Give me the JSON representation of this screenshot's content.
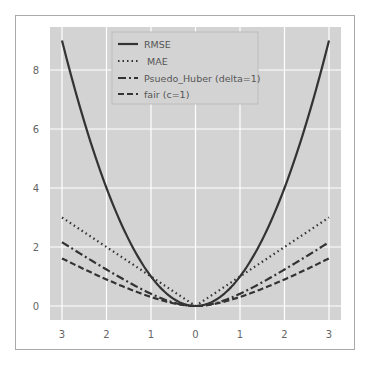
{
  "chart_data": {
    "type": "line",
    "title": "",
    "xlabel": "",
    "ylabel": "",
    "xlim": [
      -3.3,
      3.2
    ],
    "ylim": [
      -0.45,
      9.7
    ],
    "grid": true,
    "legend_position": "upper center",
    "x_ticks": [
      -3,
      -2,
      -1,
      0,
      1,
      2,
      3
    ],
    "x_tick_labels": [
      "3",
      "2",
      "1",
      "0",
      "1",
      "2",
      "3"
    ],
    "y_ticks": [
      0,
      2,
      4,
      6,
      8
    ],
    "y_tick_labels": [
      "0",
      "2",
      "4",
      "6",
      "8"
    ],
    "x": [
      -3,
      -2.5,
      -2,
      -1.5,
      -1,
      -0.5,
      0,
      0.5,
      1,
      1.5,
      2,
      2.5,
      3
    ],
    "series": [
      {
        "name": "RMSE",
        "style": "solid",
        "values": [
          9,
          6.25,
          4,
          2.25,
          1,
          0.25,
          0,
          0.25,
          1,
          2.25,
          4,
          6.25,
          9
        ]
      },
      {
        "name": "MAE",
        "style": "dotted",
        "values": [
          3,
          2.5,
          2,
          1.5,
          1,
          0.5,
          0,
          0.5,
          1,
          1.5,
          2,
          2.5,
          3
        ]
      },
      {
        "name": "Psuedo_Huber (delta=1)",
        "style": "dashdot",
        "values": [
          2.16,
          1.69,
          1.24,
          0.8,
          0.41,
          0.12,
          0,
          0.12,
          0.41,
          0.8,
          1.24,
          1.69,
          2.16
        ]
      },
      {
        "name": "fair (c=1)",
        "style": "dashed",
        "values": [
          1.61,
          1.25,
          0.9,
          0.58,
          0.31,
          0.09,
          0,
          0.09,
          0.31,
          0.58,
          0.9,
          1.25,
          1.61
        ]
      }
    ]
  },
  "legend": {
    "items": [
      "RMSE",
      "MAE",
      "Psuedo_Huber (delta=1)",
      "fair (c=1)"
    ]
  },
  "colors": {
    "plot_bg": "#d3d3d3",
    "grid": "#ffffff",
    "line": "#333333"
  }
}
